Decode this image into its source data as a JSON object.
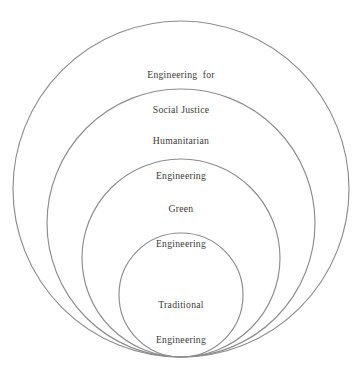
{
  "diagram": {
    "type": "nested-circles",
    "background_color": "#ffffff",
    "stroke_color": "#8c8c8c",
    "text_color": "#3a3a3a",
    "baseline_y": 357,
    "center_x": 181,
    "rings": [
      {
        "id": "engineering-for-social-justice",
        "level": 1,
        "scope": "outermost",
        "line1": "Engineering  for",
        "line2": "Social Justice",
        "cx": 181,
        "cy": 189,
        "r": 168,
        "label_x": 181,
        "label_y": 46
      },
      {
        "id": "humanitarian-engineering",
        "level": 2,
        "scope": "second",
        "line1": "Humanitarian",
        "line2": "Engineering",
        "cx": 181,
        "cy": 223,
        "r": 134,
        "label_x": 181,
        "label_y": 112
      },
      {
        "id": "green-engineering",
        "level": 3,
        "scope": "third",
        "line1": "Green",
        "line2": "Engineering",
        "cx": 181,
        "cy": 258,
        "r": 99,
        "label_x": 181,
        "label_y": 180
      },
      {
        "id": "traditional-engineering",
        "level": 4,
        "scope": "innermost",
        "line1": "Traditional",
        "line2": "Engineering",
        "cx": 181,
        "cy": 295,
        "r": 62,
        "label_x": 181,
        "label_y": 276
      }
    ]
  },
  "chart_data": {
    "type": "diagram",
    "subtype": "nested-bottom-tangent-circles",
    "title": "",
    "categories": [
      "Engineering for Social Justice",
      "Humanitarian Engineering",
      "Green Engineering",
      "Traditional Engineering"
    ],
    "values": [
      168,
      134,
      99,
      62
    ],
    "value_meaning": "circle radius in pixels (larger = broader scope)",
    "nesting_order_outer_to_inner": [
      "Engineering for Social Justice",
      "Humanitarian Engineering",
      "Green Engineering",
      "Traditional Engineering"
    ],
    "legend": [],
    "grid": false,
    "xlabel": "",
    "ylabel": ""
  }
}
